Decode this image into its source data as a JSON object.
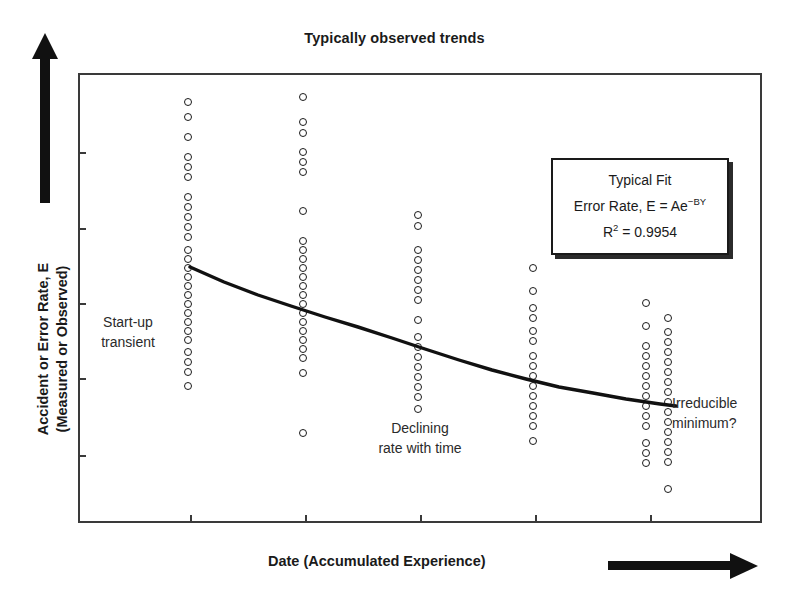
{
  "title": "Typically observed trends",
  "axes": {
    "y_label_line1": "Accident or Error Rate, E",
    "y_label_line2": "(Measured or Observed)",
    "x_label": "Date (Accumulated Experience)"
  },
  "legend": {
    "heading": "Typical Fit",
    "equation_prefix": "Error Rate, E = Ae",
    "equation_exponent": "−BY",
    "r2_symbol": "R",
    "r2_exponent": "2",
    "r2_value": "= 0.9954"
  },
  "annotations": {
    "startup": "Start-up\ntransient",
    "startup_line1": "Start-up",
    "startup_line2": "transient",
    "declining_line1": "Declining",
    "declining_line2": "rate with time",
    "irreducible_line1": "Irreducible",
    "irreducible_line2": "minimum?"
  },
  "colors": {
    "ink": "#1a1a1a",
    "frame": "#3a3a3a",
    "background": "#ffffff",
    "curve": "#111111"
  },
  "chart_data": {
    "type": "scatter",
    "title": "Typically observed trends",
    "xlabel": "Date (Accumulated Experience)",
    "ylabel": "Accident or Error Rate, E (Measured or Observed)",
    "xlim": [
      0,
      684
    ],
    "ylim": [
      0,
      450
    ],
    "grid": false,
    "legend_position": "upper-right",
    "axis_tick_labels": {
      "x": [
        "",
        "",
        "",
        "",
        ""
      ],
      "y": [
        "",
        "",
        "",
        "",
        ""
      ]
    },
    "x_tick_positions": [
      190,
      305,
      420,
      535,
      650
    ],
    "y_tick_positions": [
      152,
      228,
      303,
      378,
      455
    ],
    "note": "Axes are unlabeled/qualitative; values given in screenshot pixel coordinates.",
    "fit": {
      "model": "E = Ae^(-BY)",
      "r_squared": 0.9954,
      "curve_points": [
        [
          190,
          267
        ],
        [
          224,
          282
        ],
        [
          258,
          295
        ],
        [
          291,
          306
        ],
        [
          325,
          317
        ],
        [
          358,
          327
        ],
        [
          392,
          338
        ],
        [
          425,
          349
        ],
        [
          459,
          360
        ],
        [
          492,
          370
        ],
        [
          526,
          379
        ],
        [
          559,
          387
        ],
        [
          593,
          393
        ],
        [
          626,
          399
        ],
        [
          660,
          404
        ],
        [
          676,
          406
        ]
      ]
    },
    "series": [
      {
        "name": "Period 1",
        "x": 188,
        "y_values": [
          102,
          117,
          137,
          157,
          167,
          177,
          197,
          207,
          217,
          227,
          237,
          250,
          259,
          268,
          277,
          286,
          295,
          304,
          313,
          322,
          331,
          340,
          352,
          362,
          372,
          386
        ]
      },
      {
        "name": "Period 2",
        "x": 303,
        "y_values": [
          97,
          122,
          133,
          152,
          162,
          172,
          211,
          241,
          250,
          259,
          268,
          277,
          286,
          295,
          304,
          313,
          322,
          331,
          340,
          349,
          358,
          373,
          433
        ]
      },
      {
        "name": "Period 3",
        "x": 418,
        "y_values": [
          215,
          226,
          250,
          260,
          270,
          280,
          290,
          300,
          320,
          337,
          347,
          357,
          367,
          377,
          387,
          397,
          409
        ]
      },
      {
        "name": "Period 4",
        "x": 533,
        "y_values": [
          268,
          291,
          308,
          318,
          331,
          341,
          356,
          366,
          376,
          386,
          396,
          406,
          416,
          426,
          441
        ]
      },
      {
        "name": "Period 5a",
        "x": 646,
        "y_values": [
          303,
          326,
          346,
          356,
          366,
          376,
          386,
          396,
          406,
          416,
          426,
          443,
          453,
          463
        ]
      },
      {
        "name": "Period 5b",
        "x": 668,
        "y_values": [
          318,
          332,
          342,
          352,
          362,
          372,
          382,
          392,
          402,
          412,
          422,
          432,
          442,
          452,
          462,
          489
        ]
      }
    ]
  }
}
